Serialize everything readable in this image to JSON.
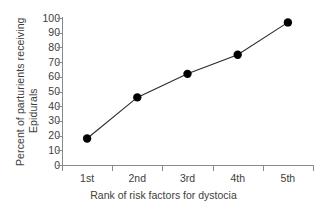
{
  "chart_data": {
    "type": "line",
    "title": "",
    "subtitle": "",
    "xlabel": "Rank of risk factors for dystocia",
    "ylabel_lines": [
      "Percent of parturients receiving",
      "Epidurals"
    ],
    "ylabel": "Percent of parturients receiving Epidurals",
    "categories": [
      "1st",
      "2nd",
      "3rd",
      "4th",
      "5th"
    ],
    "values": [
      18,
      46,
      62,
      75,
      97
    ],
    "series": [
      {
        "name": "Percent receiving epidurals",
        "values": [
          18,
          46,
          62,
          75,
          97
        ]
      }
    ],
    "ylim": [
      0,
      100
    ],
    "yticks": [
      0,
      10,
      20,
      30,
      40,
      50,
      60,
      70,
      80,
      90,
      100
    ],
    "ytick_labels": [
      "0",
      "10",
      "20",
      "30",
      "40",
      "50",
      "60",
      "70",
      "80",
      "90",
      "100"
    ],
    "xticks": [
      "1st",
      "2nd",
      "3rd",
      "4th",
      "5th"
    ],
    "grid": false,
    "legend": false,
    "legend_position": "none",
    "marker": "filled-circle",
    "marker_color": "#000000",
    "line_color": "#2b2b2b",
    "axis_color": "#8a8a8a",
    "text_color": "#3d3d3d",
    "background": "#ffffff"
  }
}
